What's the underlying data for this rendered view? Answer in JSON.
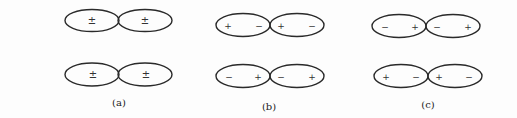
{
  "figure": {
    "panels": [
      {
        "id": "a",
        "caption": "(a)",
        "rows": [
          {
            "left_lobe": {
              "signs": [
                "±"
              ]
            },
            "right_lobe": {
              "signs": [
                "±"
              ]
            }
          },
          {
            "left_lobe": {
              "signs": [
                "±"
              ]
            },
            "right_lobe": {
              "signs": [
                "±"
              ]
            }
          }
        ]
      },
      {
        "id": "b",
        "caption": "(b)",
        "rows": [
          {
            "left_lobe": {
              "signs": [
                "+",
                "−"
              ]
            },
            "right_lobe": {
              "signs": [
                "+",
                "−"
              ]
            }
          },
          {
            "left_lobe": {
              "signs": [
                "−",
                "+"
              ]
            },
            "right_lobe": {
              "signs": [
                "−",
                "+"
              ]
            }
          }
        ]
      },
      {
        "id": "c",
        "caption": "(c)",
        "rows": [
          {
            "left_lobe": {
              "signs": [
                "−",
                "+"
              ]
            },
            "right_lobe": {
              "signs": [
                "−",
                "+"
              ]
            }
          },
          {
            "left_lobe": {
              "signs": [
                "+",
                "−"
              ]
            },
            "right_lobe": {
              "signs": [
                "+",
                "−"
              ]
            }
          }
        ]
      }
    ]
  }
}
